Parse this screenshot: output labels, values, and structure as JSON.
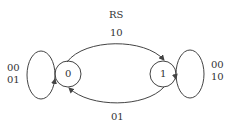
{
  "diagram": {
    "title": "RS",
    "states": [
      {
        "id": "s0",
        "label": "0"
      },
      {
        "id": "s1",
        "label": "1"
      }
    ],
    "transitions": [
      {
        "from": "0",
        "to": "1",
        "label": "10"
      },
      {
        "from": "1",
        "to": "0",
        "label": "01"
      },
      {
        "from": "0",
        "to": "0",
        "label_lines": [
          "00",
          "01"
        ]
      },
      {
        "from": "1",
        "to": "1",
        "label_lines": [
          "00",
          "10"
        ]
      }
    ],
    "colors": {
      "stroke": "#444444",
      "text": "#333333",
      "background": "#ffffff"
    }
  }
}
